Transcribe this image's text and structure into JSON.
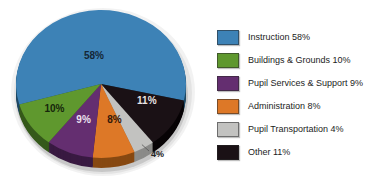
{
  "chart_data": {
    "type": "pie",
    "style": "3d-exploded-look",
    "title": "",
    "legend_position": "right",
    "background": "#ffffff",
    "slices": [
      {
        "label": "Instruction",
        "value": 58,
        "pct_label": "58%",
        "legend_label": "Instruction 58%",
        "color": "#3d82b6",
        "side_color": "#1f4964",
        "label_color": "#152736"
      },
      {
        "label": "Buildings & Grounds",
        "value": 10,
        "pct_label": "10%",
        "legend_label": "Buildings & Grounds 10%",
        "color": "#5f982e",
        "side_color": "#35591a",
        "label_color": "#16260b"
      },
      {
        "label": "Pupil Services & Support",
        "value": 9,
        "pct_label": "9%",
        "legend_label": "Pupil Services & Support 9%",
        "color": "#642e70",
        "side_color": "#391a42",
        "label_color": "#ece2ee"
      },
      {
        "label": "Administration",
        "value": 8,
        "pct_label": "8%",
        "legend_label": "Administration 8%",
        "color": "#dd7827",
        "side_color": "#874912",
        "label_color": "#33180a"
      },
      {
        "label": "Pupil Transportation",
        "value": 4,
        "pct_label": "4%",
        "legend_label": "Pupil Transportation 4%",
        "color": "#c2c2c0",
        "side_color": "#8b8b89",
        "label_color": "#222222"
      },
      {
        "label": "Other",
        "value": 11,
        "pct_label": "11%",
        "legend_label": "Other 11%",
        "color": "#1a1115",
        "side_color": "#070305",
        "label_color": "#e9e3e3"
      }
    ]
  }
}
